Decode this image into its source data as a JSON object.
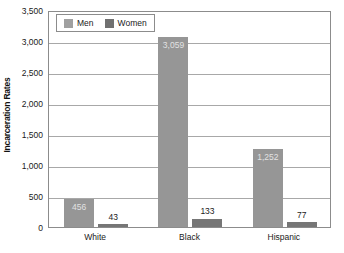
{
  "chart_data": {
    "type": "bar",
    "title": "",
    "xlabel": "",
    "ylabel": "Incarceration Rates",
    "categories": [
      "White",
      "Black",
      "Hispanic"
    ],
    "series": [
      {
        "name": "Men",
        "values": [
          456,
          3059,
          1252
        ],
        "color": "#969696"
      },
      {
        "name": "Women",
        "values": [
          43,
          133,
          77
        ],
        "color": "#767676"
      }
    ],
    "value_labels": {
      "men": [
        "456",
        "3,059",
        "1,252"
      ],
      "women": [
        "43",
        "133",
        "77"
      ]
    },
    "ylim": [
      0,
      3500
    ],
    "ytick_values": [
      0,
      500,
      1000,
      1500,
      2000,
      2500,
      3000,
      3500
    ],
    "ytick_labels": [
      "0",
      "500",
      "1,000",
      "1,500",
      "2,000",
      "2,500",
      "3,000",
      "3,500"
    ],
    "grid": true,
    "grid_axis": "y",
    "legend_position": "top-left",
    "legend_entries": [
      "Men",
      "Women"
    ]
  },
  "axis": {
    "y_title": "Incarceration Rates"
  },
  "legend": {
    "men_label": "Men",
    "women_label": "Women"
  }
}
